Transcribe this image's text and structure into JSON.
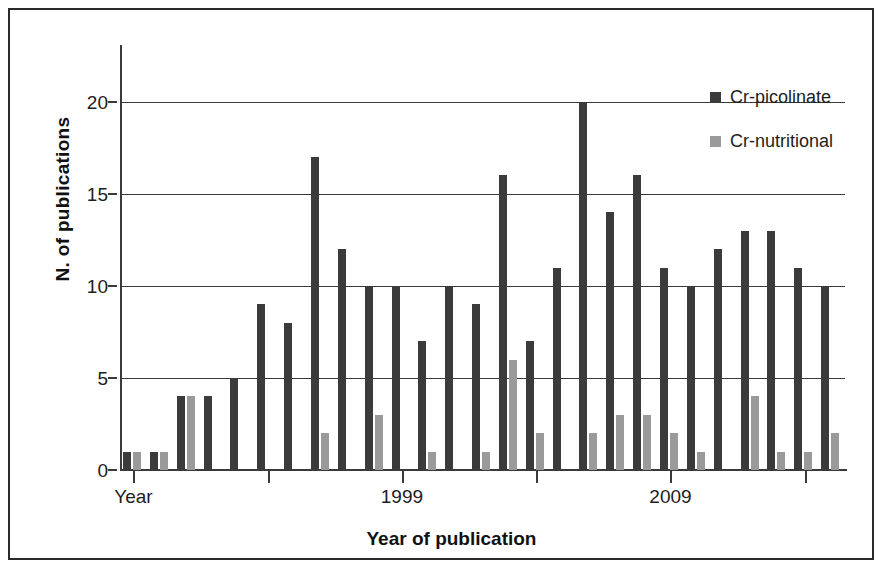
{
  "chart_data": {
    "type": "bar",
    "title": "",
    "xlabel": "Year of publication",
    "ylabel": "N. of publications",
    "ylim": [
      0,
      22
    ],
    "yticks": [
      0,
      5,
      10,
      15,
      20
    ],
    "grid": true,
    "legend_position": "top-right",
    "categories": [
      "1989",
      "1990",
      "1991",
      "1992",
      "1993",
      "1994",
      "1995",
      "1996",
      "1997",
      "1998",
      "1999",
      "2000",
      "2001",
      "2002",
      "2003",
      "2004",
      "2005",
      "2006",
      "2007",
      "2008",
      "2009",
      "2010",
      "2011",
      "2012",
      "2013",
      "2014",
      "2015"
    ],
    "x_tick_labels": [
      {
        "category": "1989",
        "label": "Year"
      },
      {
        "category": "1999",
        "label": "1999"
      },
      {
        "category": "2009",
        "label": "2009"
      }
    ],
    "series": [
      {
        "name": "Cr-picolinate",
        "color": "#3b3b3b",
        "values": [
          1,
          1,
          4,
          4,
          5,
          9,
          8,
          17,
          12,
          10,
          10,
          7,
          10,
          9,
          16,
          7,
          11,
          20,
          14,
          16,
          11,
          10,
          12,
          13,
          13,
          11,
          10
        ]
      },
      {
        "name": "Cr-nutritional",
        "color": "#9a9a9a",
        "values": [
          1,
          1,
          4,
          0,
          0,
          0,
          0,
          2,
          0,
          3,
          0,
          1,
          0,
          1,
          6,
          2,
          0,
          2,
          3,
          3,
          2,
          1,
          0,
          4,
          1,
          1,
          2
        ]
      }
    ]
  },
  "axes": {
    "y_title": "N. of publications",
    "x_title": "Year of publication",
    "y_tick_labels": [
      "20",
      "15",
      "10",
      "5",
      "0"
    ]
  },
  "legend": {
    "items": [
      {
        "label": "Cr-picolinate",
        "color": "#3b3b3b",
        "swatch": "square-dark"
      },
      {
        "label": "Cr-nutritional",
        "color": "#9a9a9a",
        "swatch": "square-light"
      }
    ]
  }
}
